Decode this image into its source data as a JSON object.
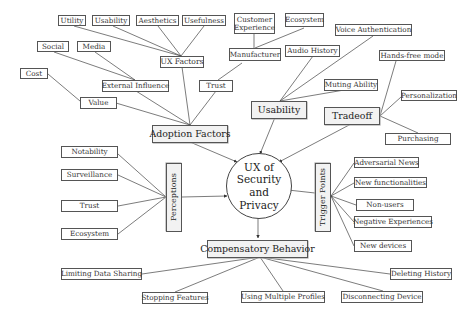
{
  "center": {
    "label": "UX of\nSecurity and\nPrivacy"
  },
  "categories": {
    "adoption_factors": "Adoption Factors",
    "usability": "Usability",
    "tradeoff": "Tradeoff",
    "perceptions": "Perceptions",
    "trigger_points": "Trigger Points",
    "compensatory_behavior": "Compensatory Behavior"
  },
  "subcategories": {
    "ux_factors": "UX Factors",
    "external_influence": "External Influence",
    "value": "Value",
    "trust": "Trust",
    "manufacturer": "Manufacturer"
  },
  "leaves": {
    "utility": "Utility",
    "usability": "Usability",
    "aesthetics": "Aesthetics",
    "usefulness": "Usefulness",
    "social": "Social",
    "media": "Media",
    "cost": "Cost",
    "customer_experience": "Customer Experience",
    "ecosystem_top": "Ecosystem",
    "voice_authentication": "Voice Authentication",
    "audio_history": "Audio History",
    "muting_ability": "Muting Ability",
    "hands_free_mode": "Hands-free mode",
    "personalization": "Personalization",
    "purchasing": "Purchasing",
    "notability": "Notability",
    "surveillance": "Surveillance",
    "trust_perception": "Trust",
    "ecosystem_perception": "Ecosystem",
    "adversarial_news": "Adversarial News",
    "new_functionalities": "New functionalities",
    "non_users": "Non-users",
    "negative_experiences": "Negative Experiences",
    "new_devices": "New devices",
    "limiting_data_sharing": "Limiting Data Sharing",
    "stopping_features": "Stopping Features",
    "using_multiple_profiles": "Using Multiple Profiles",
    "disconnecting_device": "Disconnecting Device",
    "deleting_history": "Deleting History"
  }
}
